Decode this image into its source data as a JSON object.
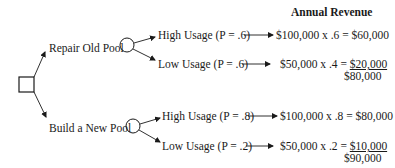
{
  "header": {
    "column_title": "Annual Revenue"
  },
  "decision_node": {
    "shape": "square"
  },
  "branches": [
    {
      "label": "Repair Old Pool",
      "outcomes": [
        {
          "label": "High Usage (P = .6)",
          "calc": "$100,000 x .6 = ",
          "result": "$60,000"
        },
        {
          "label": "Low Usage (P = .6)",
          "calc": "$50,000 x .4 = ",
          "result": "$20,000"
        }
      ],
      "total": "$80,000"
    },
    {
      "label": "Build a New Pool",
      "outcomes": [
        {
          "label": "High Usage (P = .8)",
          "calc": "$100,000 x .8 = ",
          "result": "$80,000"
        },
        {
          "label": "Low Usage (P = .2)",
          "calc": "$50,000 x .2 = ",
          "result": "$10,000"
        }
      ],
      "total": "$90,000"
    }
  ]
}
